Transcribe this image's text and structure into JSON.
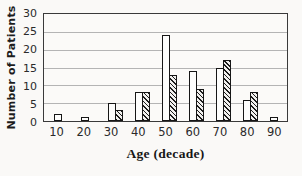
{
  "colors": {
    "background": "#faf9f7",
    "plot_background": "#fbfaf8",
    "frame": "#3a3a3a",
    "gridline": "#b4b4b4",
    "bar_outline": "#161616",
    "hatch": "#1c1c1c",
    "text": "#1c1c1c"
  },
  "chart_data": {
    "type": "bar",
    "title": "",
    "xlabel": "Age (decade)",
    "ylabel": "Number of Patients",
    "categories": [
      "10",
      "20",
      "30",
      "40",
      "50",
      "60",
      "70",
      "80",
      "90"
    ],
    "series": [
      {
        "name": "open-bars",
        "style": "white",
        "values": [
          2,
          1,
          5,
          8,
          24,
          14,
          15,
          6,
          1
        ]
      },
      {
        "name": "hatched-bars",
        "style": "diagonal-hatch",
        "values": [
          0,
          0,
          3,
          8,
          13,
          9,
          17,
          8,
          0
        ]
      }
    ],
    "ylim": [
      0,
      30
    ],
    "yticks": [
      0,
      5,
      10,
      15,
      20,
      25,
      30
    ],
    "grid": true,
    "legend_position": "none"
  }
}
